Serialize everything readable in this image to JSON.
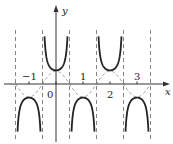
{
  "chart_data": {
    "type": "line",
    "title": "",
    "xlabel": "x",
    "ylabel": "y",
    "xlim": [
      -2.0,
      3.6
    ],
    "ylim": [
      -2.6,
      2.8
    ],
    "grid": false,
    "series": [
      {
        "name": "y = sec(πx)",
        "style": "solid",
        "color": "#222222"
      },
      {
        "name": "y = cos(πx)",
        "style": "dashed",
        "color": "#888888"
      }
    ],
    "asymptotes_x": [
      -1.5,
      -0.5,
      0.5,
      1.5,
      2.5,
      3.5
    ],
    "x_ticks": [
      -1,
      0,
      1,
      2,
      3
    ],
    "tick_labels": [
      "-1",
      "0",
      "1",
      "2",
      "3"
    ],
    "origin": {
      "px": 56,
      "py": 84
    },
    "unit_px": 27
  },
  "labels": {
    "x_axis": "x",
    "y_axis": "y",
    "origin": "0",
    "t_neg1": "−1",
    "t1": "1",
    "t2": "2",
    "t3": "3"
  }
}
